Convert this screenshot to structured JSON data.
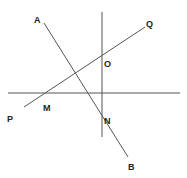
{
  "diagram": {
    "lines": [
      {
        "id": "vertical",
        "x1": 102,
        "y1": 12,
        "x2": 102,
        "y2": 137
      },
      {
        "id": "horizontal",
        "x1": 8,
        "y1": 93,
        "x2": 180,
        "y2": 93
      },
      {
        "id": "AB",
        "x1": 44,
        "y1": 23,
        "x2": 128,
        "y2": 157
      },
      {
        "id": "PQ",
        "x1": 24,
        "y1": 107,
        "x2": 145,
        "y2": 27
      }
    ],
    "labels": {
      "A": "A",
      "Q": "Q",
      "O": "O",
      "M": "M",
      "P": "P",
      "N": "N",
      "B": "B"
    },
    "line_color": "#555555",
    "text_color": "#222222"
  }
}
